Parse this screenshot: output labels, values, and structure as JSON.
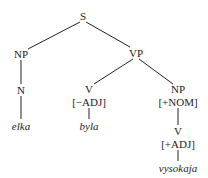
{
  "tree": {
    "nodes": {
      "s": {
        "label": "S"
      },
      "np_subj": {
        "label": "NP"
      },
      "n": {
        "label": "N"
      },
      "elka": {
        "label": "elka"
      },
      "vp": {
        "label": "VP"
      },
      "v1": {
        "label": "V"
      },
      "v1_feat": {
        "label": "[−ADJ]"
      },
      "byla": {
        "label": "byla"
      },
      "np_pred": {
        "label": "NP"
      },
      "np_pred_feat": {
        "label": "[+NOM]"
      },
      "v2": {
        "label": "V"
      },
      "v2_feat": {
        "label": "[+ADJ]"
      },
      "vysokaja": {
        "label": "vysokaja"
      }
    }
  }
}
